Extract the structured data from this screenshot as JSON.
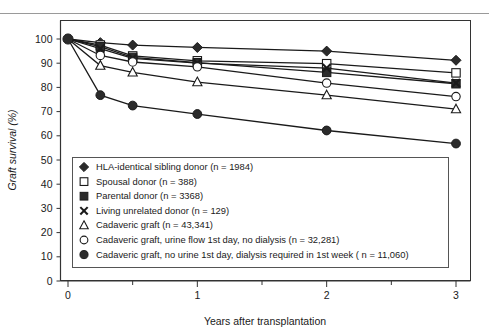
{
  "figure": {
    "background_color": "#ffffff",
    "line_color": "#1a1a1a",
    "marker_fill_dark": "#2b2b2b",
    "marker_fill_light": "#ffffff"
  },
  "chart_data": {
    "type": "line",
    "title": "",
    "xlabel": "Years after transplantation",
    "ylabel": "Graft survival (%)",
    "xlim": [
      0,
      3
    ],
    "ylim": [
      0,
      100
    ],
    "xticks": [
      0,
      1,
      2,
      3
    ],
    "xtick_labels": [
      "0",
      "1",
      "2",
      "3"
    ],
    "xminor_ticks": [
      0.5,
      1.5,
      2.5
    ],
    "yticks": [
      0,
      10,
      20,
      30,
      40,
      50,
      60,
      70,
      80,
      90,
      100
    ],
    "ytick_labels": [
      "0",
      "10",
      "20",
      "30",
      "40",
      "50",
      "60",
      "70",
      "80",
      "90",
      "100"
    ],
    "grid": false,
    "legend_position": "lower-left-inside",
    "x": [
      0,
      0.25,
      0.5,
      1,
      2,
      3
    ],
    "series": [
      {
        "name": "HLA-identical sibling donor (n = 1984)",
        "marker": "filled-diamond",
        "values": [
          100,
          98.5,
          97.5,
          96.5,
          95.0,
          91.2
        ]
      },
      {
        "name": "Spousal donor (n = 388)",
        "marker": "open-square",
        "values": [
          100,
          97.5,
          93.0,
          91.0,
          89.8,
          86.0
        ]
      },
      {
        "name": "Parental donor (n = 3368)",
        "marker": "filled-square",
        "values": [
          100,
          96.8,
          92.4,
          90.2,
          86.2,
          81.5
        ]
      },
      {
        "name": "Living unrelated donor (n = 129)",
        "marker": "x-mark",
        "values": [
          100,
          96.0,
          92.0,
          90.0,
          88.0,
          81.8
        ]
      },
      {
        "name": "Cadaveric graft (n = 43,341)",
        "marker": "open-triangle",
        "values": [
          100,
          89.0,
          86.2,
          82.2,
          76.8,
          71.0
        ]
      },
      {
        "name": "Cadaveric graft, urine flow 1st day, no dialysis (n = 32,281)",
        "marker": "open-circle",
        "values": [
          100,
          93.2,
          90.5,
          88.5,
          81.8,
          76.2
        ]
      },
      {
        "name": "Cadaveric graft, no urine 1st day, dialysis required in 1st week ( n = 11,060)",
        "marker": "filled-circle",
        "values": [
          100,
          76.8,
          72.5,
          69.0,
          62.2,
          56.8
        ]
      }
    ]
  },
  "legend": {
    "entries": [
      {
        "marker": "filled-diamond",
        "label": "HLA-identical sibling donor (n = 1984)"
      },
      {
        "marker": "open-square",
        "label": "Spousal donor (n = 388)"
      },
      {
        "marker": "filled-square",
        "label": "Parental donor (n = 3368)"
      },
      {
        "marker": "x-mark",
        "label": "Living unrelated donor (n = 129)"
      },
      {
        "marker": "open-triangle",
        "label": "Cadaveric graft (n = 43,341)"
      },
      {
        "marker": "open-circle",
        "label": "Cadaveric graft, urine flow 1st day, no dialysis (n = 32,281)"
      },
      {
        "marker": "filled-circle",
        "label": "Cadaveric graft, no urine 1st day, dialysis required in 1st week ( n = 11,060)"
      }
    ]
  }
}
